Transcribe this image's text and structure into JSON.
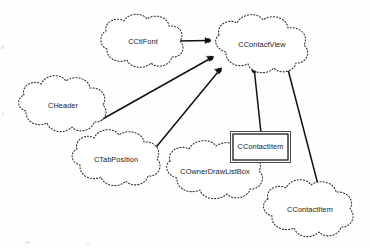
{
  "diagram": {
    "type": "class-relationship-diagram",
    "title": "",
    "background_color": "#ffffff",
    "line_color": "#111111",
    "text_color": "#1a1a1a",
    "nodes": [
      {
        "id": "cctlfont",
        "label": "CCtlFont",
        "shape": "cloud",
        "cx": 143,
        "cy": 42,
        "rx": 42,
        "ry": 26
      },
      {
        "id": "ccontactview",
        "label": "CContactView",
        "shape": "cloud",
        "cx": 262,
        "cy": 45,
        "rx": 48,
        "ry": 27
      },
      {
        "id": "cheader",
        "label": "CHeader",
        "shape": "cloud",
        "cx": 63,
        "cy": 106,
        "rx": 44,
        "ry": 26
      },
      {
        "id": "ctabposition",
        "label": "CTabPosition",
        "shape": "cloud",
        "cx": 116,
        "cy": 160,
        "rx": 45,
        "ry": 26
      },
      {
        "id": "ccontactitem-box",
        "label": "CContactItem",
        "shape": "rectangle",
        "x": 232,
        "y": 133,
        "width": 57,
        "height": 28
      },
      {
        "id": "cownerdrawlistbox",
        "label": "COwnerDrawListBox",
        "shape": "cloud",
        "cx": 215,
        "cy": 172,
        "rx": 52,
        "ry": 27
      },
      {
        "id": "ccontactitem-cloud",
        "label": "CContactItem",
        "shape": "cloud",
        "cx": 310,
        "cy": 210,
        "rx": 48,
        "ry": 27
      }
    ],
    "edges": [
      {
        "id": "edge-cctlfont-to-view",
        "from": "cctlfont",
        "to": "ccontactview",
        "arrow_at": "to",
        "x1": 176,
        "y1": 41,
        "x2": 211,
        "y2": 41
      },
      {
        "id": "edge-cheader-to-view",
        "from": "cheader",
        "to": "ccontactview",
        "arrow_at": "to",
        "x1": 100,
        "y1": 120,
        "x2": 214,
        "y2": 57
      },
      {
        "id": "edge-ctabposition-to-view",
        "from": "ctabposition",
        "to": "ccontactview",
        "arrow_at": "to",
        "x1": 155,
        "y1": 148,
        "x2": 222,
        "y2": 68
      },
      {
        "id": "edge-ccontactitem-box-to-view",
        "from": "ccontactitem-box",
        "to": "ccontactview",
        "arrow_at": "to",
        "x1": 261,
        "y1": 133,
        "x2": 254,
        "y2": 70
      },
      {
        "id": "edge-ccontactitem-cloud-to-view",
        "from": "ccontactitem-cloud",
        "to": "ccontactview",
        "arrow_at": "to",
        "x1": 321,
        "y1": 196,
        "x2": 287,
        "y2": 66
      }
    ]
  }
}
